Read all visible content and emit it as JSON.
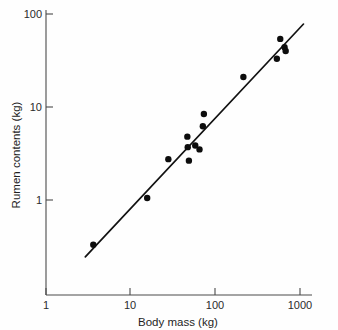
{
  "chart_data": {
    "type": "scatter",
    "title": "",
    "xlabel": "Body mass (kg)",
    "ylabel": "Rumen contents (kg)",
    "xscale": "log",
    "yscale": "log",
    "xlim": [
      1,
      1000
    ],
    "ylim": [
      1,
      100
    ],
    "xticks": [
      1,
      10,
      100,
      1000
    ],
    "xtick_labels": [
      "1",
      "10",
      "100",
      "1000"
    ],
    "yticks": [
      1,
      10,
      100
    ],
    "ytick_labels": [
      "1",
      "10",
      "100"
    ],
    "grid": false,
    "legend": null,
    "series": [
      {
        "name": "Rumen contents vs body mass",
        "marker": "filled-circle",
        "color": "#0d0d0d",
        "points": [
          {
            "x": 3.6,
            "y": 0.33
          },
          {
            "x": 15.5,
            "y": 1.05
          },
          {
            "x": 27.5,
            "y": 2.75
          },
          {
            "x": 46.0,
            "y": 4.8
          },
          {
            "x": 46.5,
            "y": 3.7
          },
          {
            "x": 48.0,
            "y": 2.65
          },
          {
            "x": 57.0,
            "y": 3.85
          },
          {
            "x": 64.0,
            "y": 3.5
          },
          {
            "x": 70.0,
            "y": 6.2
          },
          {
            "x": 72.0,
            "y": 8.4
          },
          {
            "x": 210.0,
            "y": 21.0
          },
          {
            "x": 520.0,
            "y": 33.0
          },
          {
            "x": 570.0,
            "y": 54.0
          },
          {
            "x": 640.0,
            "y": 44.0
          },
          {
            "x": 660.0,
            "y": 40.0
          }
        ]
      }
    ],
    "fit_line": {
      "name": "regression line",
      "style": "solid",
      "color": "#111111",
      "x_start": 2.9,
      "y_start": 0.245,
      "x_end": 1070.0,
      "y_end": 78.0
    },
    "annotations": []
  },
  "axes": {
    "x_title": "Body mass (kg)",
    "y_title": "Rumen contents (kg)",
    "x_tick_labels": [
      "1",
      "10",
      "100",
      "1000"
    ],
    "y_tick_labels": [
      "1",
      "10",
      "100"
    ]
  },
  "colors": {
    "marker": "#0d0d0d",
    "line": "#111111",
    "axis": "#4a4a4a",
    "background": "#fefefe",
    "text": "#1f1f1f"
  }
}
